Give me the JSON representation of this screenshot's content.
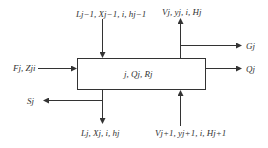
{
  "diagram": {
    "type": "stage-flow-diagram",
    "colors": {
      "line": "#333333",
      "background": "#ffffff"
    },
    "stage_box": {
      "label": "j, Q_j, R_j",
      "display": "j, Qj, Rj"
    },
    "streams": {
      "liquid_in": {
        "label": "L_{j-1}, X_{j-1,i}, h_{j-1}",
        "display": "Lj−1, Xj−1, i, hj−1",
        "direction": "in",
        "side": "top"
      },
      "vapor_out": {
        "label": "V_j, y_{j,i}, H_j",
        "display": "Vj, yj, i, Hj",
        "direction": "out",
        "side": "top"
      },
      "vapor_side": {
        "label": "G_j",
        "display": "Gj",
        "direction": "out",
        "side": "right-top"
      },
      "heat_out": {
        "label": "Q_j",
        "display": "Qj",
        "direction": "out",
        "side": "right"
      },
      "feed_in": {
        "label": "F_j, Z_ji",
        "display": "Fj, Zji",
        "direction": "in",
        "side": "left"
      },
      "liquid_side": {
        "label": "S_j",
        "display": "Sj",
        "direction": "out",
        "side": "left-bottom"
      },
      "liquid_out": {
        "label": "L_j, X_{j,i}, h_j",
        "display": "Lj, Xj, i, hj",
        "direction": "out",
        "side": "bottom"
      },
      "vapor_in": {
        "label": "V_{j+1}, y_{j+1,i}, H_{j+1}",
        "display": "Vj+1, yj+1, i, Hj+1",
        "direction": "in",
        "side": "bottom"
      }
    }
  }
}
